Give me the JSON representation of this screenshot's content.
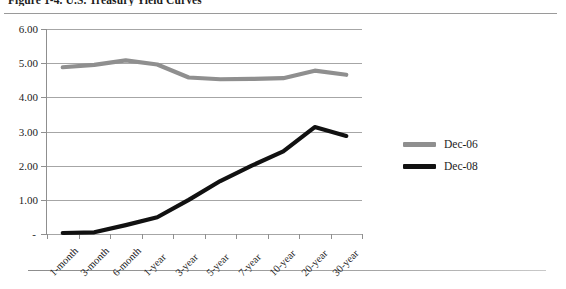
{
  "figure": {
    "caption": "Figure 1-4. U.S. Treasury Yield Curves"
  },
  "legend": {
    "position": "right",
    "items": [
      {
        "label": "Dec-06",
        "color": "#8f8f8f",
        "name": "legend-item-dec-06"
      },
      {
        "label": "Dec-08",
        "color": "#111111",
        "name": "legend-item-dec-08"
      }
    ]
  },
  "axes": {
    "y_ticks": [
      "6.00",
      "5.00",
      "4.00",
      "3.00",
      "2.00",
      "1.00",
      "-"
    ],
    "y_values": [
      6,
      5,
      4,
      3,
      2,
      1,
      0
    ],
    "x_labels": [
      "1-month",
      "3-month",
      "6-month",
      "1-year",
      "3-year",
      "5-year",
      "7-year",
      "10-year",
      "20-year",
      "30-year"
    ]
  },
  "chart_data": {
    "type": "line",
    "title": "Figure 1-4. U.S. Treasury Yield Curves",
    "xlabel": "",
    "ylabel": "",
    "ylim": [
      0,
      6
    ],
    "grid": true,
    "legend_position": "right",
    "categories": [
      "1-month",
      "3-month",
      "6-month",
      "1-year",
      "3-year",
      "5-year",
      "7-year",
      "10-year",
      "20-year",
      "30-year"
    ],
    "series": [
      {
        "name": "Dec-06",
        "color": "#8f8f8f",
        "values": [
          4.88,
          4.95,
          5.08,
          4.96,
          4.58,
          4.53,
          4.54,
          4.56,
          4.78,
          4.66
        ]
      },
      {
        "name": "Dec-08",
        "color": "#111111",
        "values": [
          0.03,
          0.05,
          0.26,
          0.49,
          1.0,
          1.55,
          2.0,
          2.42,
          3.13,
          2.87
        ]
      }
    ]
  }
}
